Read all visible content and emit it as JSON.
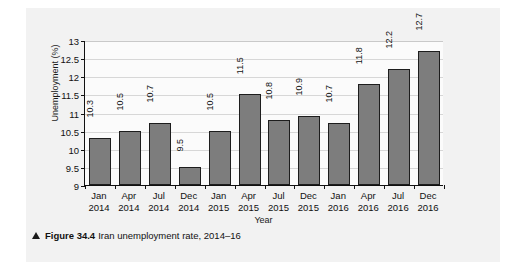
{
  "figure": {
    "caption_marker": "triangle-up-icon",
    "caption_figure_no": "Figure 34.4",
    "caption_text": "Iran unemployment rate, 2014–16"
  },
  "chart_data": {
    "type": "bar",
    "title": "",
    "xlabel": "Year",
    "ylabel": "Unemployment (%)",
    "ylim": [
      9,
      13
    ],
    "yticks": [
      9,
      9.5,
      10,
      10.5,
      11,
      11.5,
      12,
      12.5,
      13
    ],
    "ytick_labels": [
      "9",
      "9.5",
      "10",
      "10.5",
      "11",
      "11.5",
      "12",
      "12.5",
      "13"
    ],
    "grid": true,
    "legend": false,
    "bar_color": "#7d7d7d",
    "bar_edge_color": "#1d1d1d",
    "categories": [
      {
        "month": "Jan",
        "year": "2014"
      },
      {
        "month": "Apr",
        "year": "2014"
      },
      {
        "month": "Jul",
        "year": "2014"
      },
      {
        "month": "Dec",
        "year": "2014"
      },
      {
        "month": "Jan",
        "year": "2015"
      },
      {
        "month": "Apr",
        "year": "2015"
      },
      {
        "month": "Jul",
        "year": "2015"
      },
      {
        "month": "Dec",
        "year": "2015"
      },
      {
        "month": "Jan",
        "year": "2016"
      },
      {
        "month": "Apr",
        "year": "2016"
      },
      {
        "month": "Jul",
        "year": "2016"
      },
      {
        "month": "Dec",
        "year": "2016"
      }
    ],
    "values": [
      10.3,
      10.5,
      10.7,
      9.5,
      10.5,
      11.5,
      10.8,
      10.9,
      10.7,
      11.8,
      12.2,
      12.7
    ],
    "value_labels": [
      "10.3",
      "10.5",
      "10.7",
      "9.5",
      "10.5",
      "11.5",
      "10.8",
      "10.9",
      "10.7",
      "11.8",
      "12.2",
      "12.7"
    ]
  }
}
